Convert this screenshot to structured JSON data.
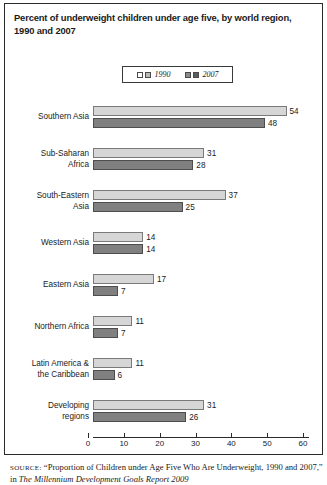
{
  "title": "Percent of underweight children under age five, by world region, 1990 and 2007",
  "legend": {
    "entries": [
      {
        "label": "1990",
        "color": "#d6d6d6"
      },
      {
        "label": "2007",
        "color": "#808080"
      }
    ]
  },
  "axis": {
    "ticks": [
      "0",
      "10",
      "20",
      "30",
      "40",
      "50",
      "60"
    ],
    "min": 0,
    "max": 60
  },
  "source": {
    "prefix": "SOURCE:",
    "line1": "“Proportion of Children under Age Five Who Are Underweight,",
    "line2_a": "1990 and 2007,” in ",
    "line2_italic": "The Millennium Development Goals Report 2009",
    "line2_b": ""
  },
  "chart_data": {
    "type": "bar",
    "orientation": "horizontal",
    "title": "Percent of underweight children under age five, by world region, 1990 and 2007",
    "xlabel": "",
    "ylabel": "",
    "xlim": [
      0,
      60
    ],
    "xticks": [
      0,
      10,
      20,
      30,
      40,
      50,
      60
    ],
    "grid": false,
    "legend_position": "top-center",
    "categories": [
      "Southern Asia",
      "Sub-Saharan Africa",
      "South-Eastern Asia",
      "Western Asia",
      "Eastern Asia",
      "Northern Africa",
      "Latin America & the Caribbean",
      "Developing regions"
    ],
    "series": [
      {
        "name": "1990",
        "color": "#d6d6d6",
        "values": [
          54,
          31,
          37,
          14,
          17,
          11,
          11,
          31
        ]
      },
      {
        "name": "2007",
        "color": "#808080",
        "values": [
          48,
          28,
          25,
          14,
          7,
          7,
          6,
          26
        ]
      }
    ]
  },
  "category_lines": [
    [
      "Southern Asia"
    ],
    [
      "Sub-Saharan",
      "Africa"
    ],
    [
      "South-Eastern",
      "Asia"
    ],
    [
      "Western Asia"
    ],
    [
      "Eastern Asia"
    ],
    [
      "Northern Africa"
    ],
    [
      "Latin America &",
      "the Caribbean"
    ],
    [
      "Developing",
      "regions"
    ]
  ]
}
